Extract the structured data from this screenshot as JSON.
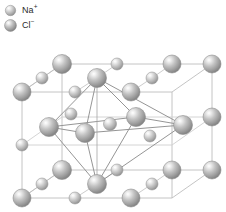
{
  "figure": {
    "background_color": "#ffffff",
    "projection": "oblique parallel projection"
  },
  "legend": {
    "items": [
      {
        "id": "na-plus",
        "label": "Na",
        "charge": "+",
        "swatch_icon": "sphere-icon",
        "sphere_size": "small",
        "radius_px": 5.6,
        "color_light": "#f2f2f2",
        "color_mid": "#b9b9b9",
        "color_edge": "#8a8a8a"
      },
      {
        "id": "cl-minus",
        "label": "Cl",
        "charge": "−",
        "swatch_icon": "sphere-icon",
        "sphere_size": "large",
        "radius_px": 8.2,
        "color_light": "#f2f2f2",
        "color_mid": "#b0b0b0",
        "color_edge": "#7d7d7d"
      }
    ]
  },
  "lattice": {
    "cube_edge_color": "#b5b5b5",
    "bond_line_color": "#a8a8a8",
    "octahedron_line_color": "#8c8c8c",
    "cube_corners_px": {
      "front_top_left": [
        22,
        92
      ],
      "front_top_right": [
        172,
        92
      ],
      "back_top_left": [
        62,
        64
      ],
      "back_top_right": [
        212,
        64
      ],
      "front_bottom_left": [
        22,
        198
      ],
      "front_bottom_right": [
        172,
        198
      ],
      "back_bottom_left": [
        62,
        170
      ],
      "back_bottom_right": [
        212,
        170
      ]
    },
    "top_face_ions": [
      {
        "type": "cl-minus",
        "x": 22,
        "y": 92,
        "r": 9.0
      },
      {
        "type": "na-plus",
        "x": 42,
        "y": 78,
        "r": 6.0
      },
      {
        "type": "cl-minus",
        "x": 62,
        "y": 64,
        "r": 9.5
      },
      {
        "type": "na-plus",
        "x": 75,
        "y": 92,
        "r": 6.0
      },
      {
        "type": "cl-minus",
        "x": 97,
        "y": 78,
        "r": 9.5
      },
      {
        "type": "na-plus",
        "x": 117,
        "y": 64,
        "r": 6.0
      },
      {
        "type": "cl-minus",
        "x": 131,
        "y": 92,
        "r": 9.0
      },
      {
        "type": "na-plus",
        "x": 152,
        "y": 78,
        "r": 6.0
      },
      {
        "type": "cl-minus",
        "x": 172,
        "y": 64,
        "r": 9.0
      },
      {
        "type": "cl-minus",
        "x": 212,
        "y": 64,
        "r": 9.0
      }
    ],
    "middle_face_ions": [
      {
        "type": "cl-minus",
        "x": 22,
        "y": 145,
        "r": 9.0
      },
      {
        "type": "cl-minus",
        "x": 49,
        "y": 127,
        "r": 9.5
      },
      {
        "type": "na-plus",
        "x": 71,
        "y": 114,
        "r": 6.0
      },
      {
        "type": "cl-minus",
        "x": 85,
        "y": 133,
        "r": 9.5
      },
      {
        "type": "na-plus",
        "x": 110,
        "y": 124,
        "r": 6.5
      },
      {
        "type": "cl-minus",
        "x": 136,
        "y": 117,
        "r": 9.5
      },
      {
        "type": "na-plus",
        "x": 150,
        "y": 136,
        "r": 6.0
      },
      {
        "type": "cl-minus",
        "x": 183,
        "y": 125,
        "r": 9.5
      },
      {
        "type": "cl-minus",
        "x": 212,
        "y": 117,
        "r": 9.0
      }
    ],
    "bottom_face_ions": [
      {
        "type": "cl-minus",
        "x": 22,
        "y": 198,
        "r": 9.0
      },
      {
        "type": "na-plus",
        "x": 42,
        "y": 184,
        "r": 6.0
      },
      {
        "type": "cl-minus",
        "x": 62,
        "y": 170,
        "r": 9.5
      },
      {
        "type": "na-plus",
        "x": 75,
        "y": 198,
        "r": 6.0
      },
      {
        "type": "cl-minus",
        "x": 97,
        "y": 184,
        "r": 9.5
      },
      {
        "type": "na-plus",
        "x": 117,
        "y": 170,
        "r": 6.0
      },
      {
        "type": "cl-minus",
        "x": 131,
        "y": 198,
        "r": 9.0
      },
      {
        "type": "na-plus",
        "x": 152,
        "y": 184,
        "r": 6.0
      },
      {
        "type": "cl-minus",
        "x": 172,
        "y": 170,
        "r": 9.0
      },
      {
        "type": "cl-minus",
        "x": 212,
        "y": 170,
        "r": 9.0
      }
    ],
    "octahedron": {
      "description": "Six chloride ions octahedrally coordinating one central sodium ion",
      "apex_top_px": [
        97,
        78
      ],
      "apex_bottom_px": [
        97,
        184
      ],
      "equator_px": [
        [
          49,
          127
        ],
        [
          136,
          117
        ],
        [
          183,
          125
        ],
        [
          85,
          133
        ]
      ],
      "center_ion_px": [
        110,
        124
      ]
    }
  }
}
